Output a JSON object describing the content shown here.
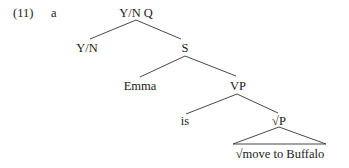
{
  "example": {
    "number": "(11)",
    "letter": "a"
  },
  "tree": {
    "root": "Y/N Q",
    "nodes": {
      "yn": "Y/N",
      "s": "S",
      "emma": "Emma",
      "vp": "VP",
      "is": "is",
      "rootp": "√P",
      "leaf": "√move to Buffalo"
    },
    "structure": [
      {
        "parent": "Y/N Q",
        "children": [
          "Y/N",
          "S"
        ]
      },
      {
        "parent": "S",
        "children": [
          "Emma",
          "VP"
        ]
      },
      {
        "parent": "VP",
        "children": [
          "is",
          "√P"
        ]
      },
      {
        "parent": "√P",
        "children": [
          "√move to Buffalo"
        ],
        "triangle": true
      }
    ]
  }
}
